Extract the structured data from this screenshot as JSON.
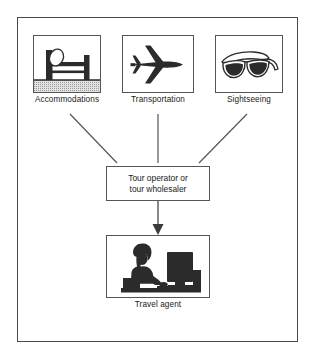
{
  "diagram": {
    "frame": {
      "name": "outer-frame"
    },
    "suppliers": [
      {
        "id": "accommodations",
        "label": "Accommodations",
        "icon": "bed-icon"
      },
      {
        "id": "transportation",
        "label": "Transportation",
        "icon": "airplane-icon"
      },
      {
        "id": "sightseeing",
        "label": "Sightseeing",
        "icon": "sunglasses-icon"
      }
    ],
    "process": {
      "id": "tour-operator",
      "line1": "Tour operator or",
      "line2": "tour wholesaler"
    },
    "agent": {
      "id": "travel-agent",
      "label": "Travel agent",
      "icon": "person-at-computer-icon"
    },
    "connectors": [
      {
        "from": "accommodations",
        "to": "tour-operator",
        "style": "plain-line"
      },
      {
        "from": "transportation",
        "to": "tour-operator",
        "style": "plain-line"
      },
      {
        "from": "sightseeing",
        "to": "tour-operator",
        "style": "plain-line"
      },
      {
        "from": "tour-operator",
        "to": "travel-agent",
        "style": "arrow"
      }
    ],
    "colors": {
      "ink": "#1a1a1a",
      "line": "#555555",
      "frame": "#4a4a4a",
      "page": "#ffffff",
      "fill_dark": "#2b2b2b",
      "floor_texture": "#cfcfcf"
    }
  }
}
